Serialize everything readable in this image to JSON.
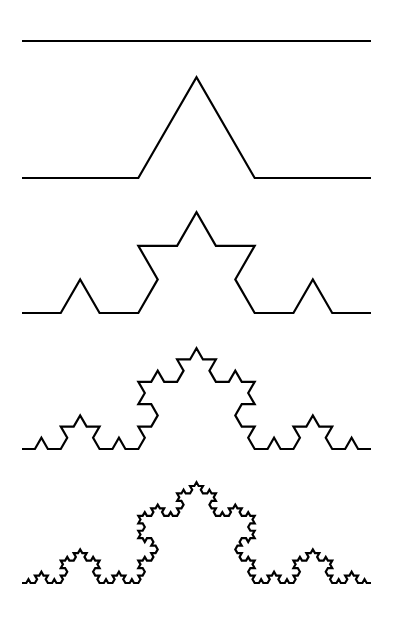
{
  "figure": {
    "background_color": "#ffffff",
    "stroke_color": "#000000",
    "stroke_width": 2.2,
    "canvas": {
      "width": 396,
      "height": 623
    }
  },
  "chart_data": {
    "type": "line",
    "subtitle": "",
    "xlabel": "",
    "ylabel": "",
    "xlim": [
      0,
      396
    ],
    "ylim": [
      0,
      623
    ],
    "grid": false,
    "legend": "none",
    "axes_visible": false,
    "tick_labels": [],
    "annotations": [],
    "generator": {
      "rule": "koch",
      "segment_split": 3,
      "bump_angle_degrees": 60,
      "start_x": 22,
      "end_x": 371,
      "segment_length": 349
    },
    "series": [
      {
        "name": "iteration-0",
        "order": 0,
        "segments": 1,
        "baseline_y": 41,
        "peak_y": 41,
        "x_start": 22,
        "x_end": 371,
        "points": [
          [
            22,
            41
          ],
          [
            371,
            41
          ]
        ]
      },
      {
        "name": "iteration-1",
        "order": 1,
        "segments": 4,
        "baseline_y": 178,
        "peak_y": 77.3,
        "x_start": 22,
        "x_end": 371,
        "points": [
          [
            22,
            178
          ],
          [
            138.33,
            178
          ],
          [
            196.5,
            77.27
          ],
          [
            254.67,
            178
          ],
          [
            371,
            178
          ]
        ]
      },
      {
        "name": "iteration-2",
        "order": 2,
        "segments": 16,
        "baseline_y": 313,
        "peak_y": 212.3,
        "x_start": 22,
        "x_end": 371
      },
      {
        "name": "iteration-3",
        "order": 3,
        "segments": 64,
        "baseline_y": 449,
        "peak_y": 348.3,
        "x_start": 22,
        "x_end": 371
      },
      {
        "name": "iteration-4",
        "order": 4,
        "segments": 256,
        "baseline_y": 583,
        "peak_y": 482.3,
        "x_start": 22,
        "x_end": 371
      }
    ]
  }
}
